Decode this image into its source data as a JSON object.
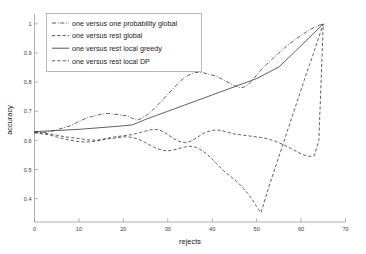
{
  "chart_data": {
    "type": "line",
    "title": "",
    "xlabel": "rejects",
    "ylabel": "accuracy",
    "xlim": [
      0,
      70
    ],
    "ylim": [
      0.32,
      1.02
    ],
    "xticks": [
      0,
      10,
      20,
      30,
      40,
      50,
      60,
      70
    ],
    "xticklabels": [
      "0",
      "10",
      "20",
      "30",
      "40",
      "50",
      "60",
      "70"
    ],
    "yticks": [
      0.4,
      0.5,
      0.6,
      0.7,
      0.8,
      0.9,
      1
    ],
    "yticklabels": [
      "0.4",
      "0.5",
      "0.6",
      "0.7",
      "0.8",
      "0.9",
      "1"
    ],
    "grid": false,
    "legend_position": "upper left",
    "series": [
      {
        "name": "one versus one probability global",
        "style": "dashdot",
        "color": "#2b2b2b",
        "x": [
          0,
          1,
          2,
          3,
          4,
          5,
          6,
          7,
          8,
          9,
          10,
          11,
          12,
          13,
          14,
          15,
          16,
          17,
          18,
          19,
          20,
          21,
          22,
          23,
          24,
          25,
          26,
          27,
          28,
          29,
          30,
          31,
          32,
          33,
          34,
          35,
          36,
          37,
          38,
          39,
          40,
          41,
          42,
          43,
          44,
          45,
          46,
          47,
          48,
          49,
          50,
          51,
          52,
          53,
          54,
          55,
          56,
          57,
          58,
          59,
          60,
          61,
          62,
          63,
          64,
          65
        ],
        "y": [
          0.63,
          0.628,
          0.627,
          0.629,
          0.632,
          0.636,
          0.641,
          0.645,
          0.65,
          0.657,
          0.665,
          0.672,
          0.678,
          0.682,
          0.686,
          0.69,
          0.692,
          0.692,
          0.69,
          0.688,
          0.686,
          0.684,
          0.676,
          0.669,
          0.675,
          0.684,
          0.696,
          0.71,
          0.726,
          0.742,
          0.758,
          0.774,
          0.79,
          0.806,
          0.818,
          0.826,
          0.832,
          0.834,
          0.832,
          0.828,
          0.824,
          0.82,
          0.812,
          0.804,
          0.796,
          0.788,
          0.782,
          0.782,
          0.79,
          0.806,
          0.824,
          0.842,
          0.858,
          0.872,
          0.886,
          0.9,
          0.914,
          0.926,
          0.938,
          0.95,
          0.96,
          0.97,
          0.98,
          0.988,
          0.995,
          1.0
        ]
      },
      {
        "name": "one versus rest global",
        "style": "dashed",
        "color": "#2b2b2b",
        "x": [
          0,
          1,
          2,
          3,
          4,
          5,
          6,
          7,
          8,
          9,
          10,
          11,
          12,
          13,
          14,
          15,
          16,
          17,
          18,
          19,
          20,
          21,
          22,
          23,
          24,
          25,
          26,
          27,
          28,
          29,
          30,
          31,
          32,
          33,
          34,
          35,
          36,
          37,
          38,
          39,
          40,
          41,
          42,
          43,
          44,
          45,
          46,
          47,
          48,
          49,
          50,
          51,
          52,
          53,
          54,
          55,
          56,
          57,
          58,
          59,
          60,
          61,
          62,
          63,
          64,
          65
        ],
        "y": [
          0.627,
          0.626,
          0.625,
          0.623,
          0.621,
          0.618,
          0.615,
          0.612,
          0.61,
          0.608,
          0.606,
          0.604,
          0.602,
          0.601,
          0.601,
          0.603,
          0.606,
          0.609,
          0.612,
          0.614,
          0.616,
          0.618,
          0.62,
          0.624,
          0.628,
          0.632,
          0.636,
          0.638,
          0.636,
          0.63,
          0.62,
          0.61,
          0.6,
          0.594,
          0.592,
          0.596,
          0.604,
          0.614,
          0.624,
          0.63,
          0.634,
          0.636,
          0.634,
          0.63,
          0.626,
          0.622,
          0.62,
          0.618,
          0.616,
          0.614,
          0.612,
          0.61,
          0.607,
          0.603,
          0.598,
          0.592,
          0.585,
          0.578,
          0.57,
          0.562,
          0.554,
          0.548,
          0.545,
          0.548,
          0.6,
          1.0
        ]
      },
      {
        "name": "one versus rest local greedy",
        "style": "solid",
        "color": "#2b2b2b",
        "x": [
          0,
          5,
          10,
          15,
          20,
          22,
          25,
          30,
          35,
          40,
          45,
          50,
          55,
          60,
          65
        ],
        "y": [
          0.63,
          0.634,
          0.638,
          0.644,
          0.65,
          0.653,
          0.672,
          0.7,
          0.728,
          0.756,
          0.784,
          0.812,
          0.852,
          0.925,
          1.0
        ]
      },
      {
        "name": "one versus rest local DP",
        "style": "dashed",
        "color": "#2b2b2b",
        "x": [
          0,
          1,
          2,
          3,
          4,
          5,
          6,
          7,
          8,
          9,
          10,
          11,
          12,
          13,
          14,
          15,
          16,
          17,
          18,
          19,
          20,
          21,
          22,
          23,
          24,
          25,
          26,
          27,
          28,
          29,
          30,
          31,
          32,
          33,
          34,
          35,
          36,
          37,
          38,
          39,
          40,
          41,
          42,
          43,
          44,
          45,
          46,
          47,
          48,
          49,
          50,
          51,
          52,
          53,
          54,
          55,
          56,
          57,
          58,
          59,
          60,
          61,
          62,
          63,
          64,
          65
        ],
        "y": [
          0.626,
          0.624,
          0.622,
          0.62,
          0.616,
          0.612,
          0.608,
          0.604,
          0.601,
          0.598,
          0.596,
          0.595,
          0.595,
          0.596,
          0.598,
          0.601,
          0.604,
          0.606,
          0.608,
          0.61,
          0.612,
          0.612,
          0.61,
          0.606,
          0.6,
          0.592,
          0.584,
          0.576,
          0.57,
          0.566,
          0.564,
          0.566,
          0.57,
          0.574,
          0.578,
          0.58,
          0.578,
          0.572,
          0.562,
          0.55,
          0.536,
          0.52,
          0.504,
          0.49,
          0.478,
          0.466,
          0.452,
          0.436,
          0.418,
          0.398,
          0.372,
          0.352,
          0.404,
          0.452,
          0.498,
          0.544,
          0.59,
          0.636,
          0.682,
          0.728,
          0.774,
          0.82,
          0.864,
          0.908,
          0.954,
          1.0
        ]
      }
    ]
  },
  "legend": {
    "items": [
      {
        "label": "one versus one probability global",
        "style": "dashdot"
      },
      {
        "label": "one versus rest global",
        "style": "dashed"
      },
      {
        "label": "one versus rest local greedy",
        "style": "solid"
      },
      {
        "label": "one versus rest local DP",
        "style": "dashed"
      }
    ]
  }
}
